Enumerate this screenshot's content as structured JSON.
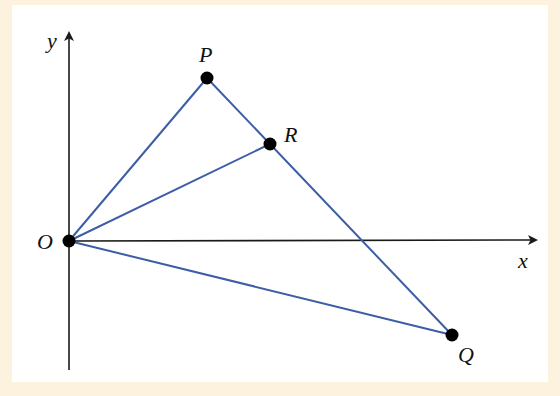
{
  "figure": {
    "background_color": "#fcf2de",
    "panel_color": "#ffffff",
    "line_color": "#3d5da6",
    "axis_color": "#1a1a1a",
    "point_color": "#000000"
  },
  "axes": {
    "x_label": "x",
    "y_label": "y",
    "origin_label": "O"
  },
  "points": {
    "O": {
      "label": "O",
      "x": 69,
      "y": 241
    },
    "P": {
      "label": "P",
      "x": 207,
      "y": 78
    },
    "R": {
      "label": "R",
      "x": 270,
      "y": 144
    },
    "Q": {
      "label": "Q",
      "x": 452,
      "y": 335
    }
  },
  "segments": [
    {
      "from": "O",
      "to": "P"
    },
    {
      "from": "O",
      "to": "R"
    },
    {
      "from": "O",
      "to": "Q"
    },
    {
      "from": "P",
      "to": "Q"
    }
  ]
}
